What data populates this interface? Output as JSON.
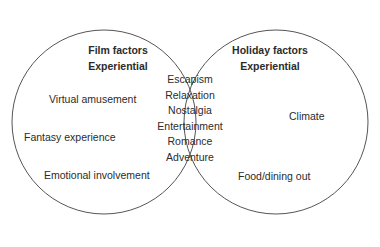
{
  "diagram": {
    "type": "venn",
    "stroke_color": "#555555",
    "left_set": {
      "title": "Film factors",
      "subtitle": "Experiential",
      "items": [
        "Virtual amusement",
        "Fantasy experience",
        "Emotional involvement"
      ]
    },
    "right_set": {
      "title": "Holiday factors",
      "subtitle": "Experiential",
      "items": [
        "Climate",
        "Food/dining out"
      ]
    },
    "intersection": {
      "items": [
        "Escapism",
        "Relaxation",
        "Nostalgia",
        "Entertainment",
        "Romance",
        "Adventure"
      ]
    }
  }
}
